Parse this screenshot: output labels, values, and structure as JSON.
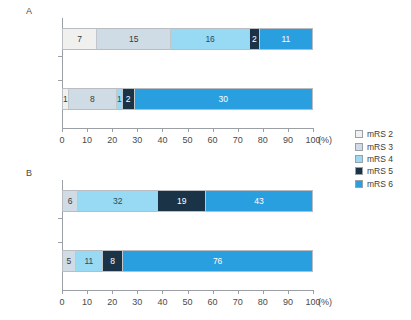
{
  "chart_data": [
    {
      "id": "A",
      "type": "bar",
      "orientation": "horizontal",
      "stacked": true,
      "normalized": false,
      "title": "A",
      "xlabel": "(%)",
      "ylabel": "",
      "xlim": [
        0,
        100
      ],
      "xticks": [
        0,
        10,
        20,
        30,
        40,
        50,
        60,
        70,
        80,
        90,
        100
      ],
      "xtick_labels": [
        "0",
        "10",
        "20",
        "30",
        "40",
        "50",
        "60",
        "70",
        "80",
        "90",
        "100"
      ],
      "unit": "(%)",
      "grid": false,
      "categories": [
        "減圧開頭",
        "保存的"
      ],
      "series": [
        {
          "name": "mRS 2",
          "values": [
            7,
            1
          ]
        },
        {
          "name": "mRS 3",
          "values": [
            15,
            8
          ]
        },
        {
          "name": "mRS 4",
          "values": [
            16,
            1
          ]
        },
        {
          "name": "mRS 5",
          "values": [
            2,
            2
          ]
        },
        {
          "name": "mRS 6",
          "values": [
            11,
            30
          ]
        }
      ],
      "rows": [
        {
          "label": "減圧開頭",
          "total": 51,
          "segments": [
            {
              "series": "mRS 2",
              "value": 7,
              "label": "7",
              "pct": 13.725,
              "color": "#f0f0ef",
              "text_color": "#3a3a3a"
            },
            {
              "series": "mRS 3",
              "value": 15,
              "label": "15",
              "pct": 29.412,
              "color": "#cfdce5",
              "text_color": "#3a3a3a"
            },
            {
              "series": "mRS 4",
              "value": 16,
              "label": "16",
              "pct": 31.373,
              "color": "#98d9f3",
              "text_color": "#2b4a5a"
            },
            {
              "series": "mRS 5",
              "value": 2,
              "label": "2",
              "pct": 3.922,
              "color": "#1b3347",
              "text_color": "#ffffff"
            },
            {
              "series": "mRS 6",
              "value": 11,
              "label": "11",
              "pct": 21.569,
              "color": "#2a9fe0",
              "text_color": "#ffffff"
            }
          ]
        },
        {
          "label": "保存的",
          "total": 42,
          "segments": [
            {
              "series": "mRS 2",
              "value": 1,
              "label": "1",
              "pct": 2.381,
              "color": "#f0f0ef",
              "text_color": "#3a3a3a"
            },
            {
              "series": "mRS 3",
              "value": 8,
              "label": "8",
              "pct": 19.048,
              "color": "#cfdce5",
              "text_color": "#3a3a3a"
            },
            {
              "series": "mRS 4",
              "value": 1,
              "label": "1",
              "pct": 2.381,
              "color": "#98d9f3",
              "text_color": "#2b4a5a"
            },
            {
              "series": "mRS 5",
              "value": 2,
              "label": "2",
              "pct": 4.762,
              "color": "#1b3347",
              "text_color": "#ffffff"
            },
            {
              "series": "mRS 6",
              "value": 30,
              "label": "30",
              "pct": 71.429,
              "color": "#2a9fe0",
              "text_color": "#ffffff"
            }
          ]
        }
      ]
    },
    {
      "id": "B",
      "type": "bar",
      "orientation": "horizontal",
      "stacked": true,
      "normalized": true,
      "title": "B",
      "xlabel": "(%)",
      "ylabel": "",
      "xlim": [
        0,
        100
      ],
      "xticks": [
        0,
        10,
        20,
        30,
        40,
        50,
        60,
        70,
        80,
        90,
        100
      ],
      "xtick_labels": [
        "0",
        "10",
        "20",
        "30",
        "40",
        "50",
        "60",
        "70",
        "80",
        "90",
        "100"
      ],
      "unit": "(%)",
      "grid": false,
      "categories": [
        "減圧開頭",
        "保存的"
      ],
      "series": [
        {
          "name": "mRS 2",
          "values": [
            0,
            0
          ]
        },
        {
          "name": "mRS 3",
          "values": [
            6,
            5
          ]
        },
        {
          "name": "mRS 4",
          "values": [
            32,
            11
          ]
        },
        {
          "name": "mRS 5",
          "values": [
            19,
            8
          ]
        },
        {
          "name": "mRS 6",
          "values": [
            43,
            76
          ]
        }
      ],
      "rows": [
        {
          "label": "減圧開頭",
          "total": 100,
          "segments": [
            {
              "series": "mRS 3",
              "value": 6,
              "label": "6",
              "pct": 6,
              "color": "#cfdce5",
              "text_color": "#3a3a3a"
            },
            {
              "series": "mRS 4",
              "value": 32,
              "label": "32",
              "pct": 32,
              "color": "#98d9f3",
              "text_color": "#2b4a5a"
            },
            {
              "series": "mRS 5",
              "value": 19,
              "label": "19",
              "pct": 19,
              "color": "#1b3347",
              "text_color": "#ffffff"
            },
            {
              "series": "mRS 6",
              "value": 43,
              "label": "43",
              "pct": 43,
              "color": "#2a9fe0",
              "text_color": "#ffffff"
            }
          ]
        },
        {
          "label": "保存的",
          "total": 100,
          "segments": [
            {
              "series": "mRS 3",
              "value": 5,
              "label": "5",
              "pct": 5,
              "color": "#cfdce5",
              "text_color": "#3a3a3a"
            },
            {
              "series": "mRS 4",
              "value": 11,
              "label": "11",
              "pct": 11,
              "color": "#98d9f3",
              "text_color": "#2b4a5a"
            },
            {
              "series": "mRS 5",
              "value": 8,
              "label": "8",
              "pct": 8,
              "color": "#1b3347",
              "text_color": "#ffffff"
            },
            {
              "series": "mRS 6",
              "value": 76,
              "label": "76",
              "pct": 76,
              "color": "#2a9fe0",
              "text_color": "#ffffff"
            }
          ]
        }
      ]
    }
  ],
  "legend": {
    "position": "right",
    "items": [
      {
        "label": "mRS 2",
        "color": "#f0f0ef"
      },
      {
        "label": "mRS 3",
        "color": "#cfdce5"
      },
      {
        "label": "mRS 4",
        "color": "#98d9f3"
      },
      {
        "label": "mRS 5",
        "color": "#1b3347"
      },
      {
        "label": "mRS 6",
        "color": "#2a9fe0"
      }
    ]
  }
}
